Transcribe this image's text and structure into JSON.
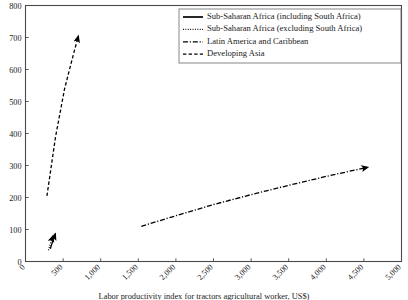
{
  "chart_data": {
    "type": "line",
    "title": "",
    "subtitle": "",
    "xlabel": "Labor productivity index for tractors agricultural worker, US$)",
    "ylabel": "",
    "xlim": [
      0,
      5000
    ],
    "ylim": [
      0,
      800
    ],
    "grid": false,
    "legend_position": "top-right",
    "xticks": [
      0,
      500,
      1000,
      1500,
      2000,
      2500,
      3000,
      3500,
      4000,
      4500,
      5000
    ],
    "xtick_labels": [
      "0",
      "500",
      "1,000",
      "1,500",
      "2,000",
      "2,500",
      "3,000",
      "3,500",
      "4,000",
      "4,500",
      "5,000"
    ],
    "yticks": [
      0,
      100,
      200,
      300,
      400,
      500,
      600,
      700,
      800
    ],
    "ytick_labels": [
      "0",
      "100",
      "200",
      "300",
      "400",
      "500",
      "600",
      "700",
      "800"
    ],
    "series": [
      {
        "name": "Sub-Saharan Africa (including South Africa)",
        "style": "solid",
        "arrow": true,
        "points": [
          [
            330,
            40
          ],
          [
            360,
            62
          ],
          [
            400,
            88
          ]
        ]
      },
      {
        "name": "Sub-Saharan Africa (excluding South Africa)",
        "style": "dotted",
        "arrow": true,
        "points": [
          [
            305,
            35
          ],
          [
            330,
            55
          ],
          [
            370,
            82
          ]
        ]
      },
      {
        "name": "Latin America and Caribbean",
        "style": "dashdot",
        "arrow": true,
        "points": [
          [
            1540,
            110
          ],
          [
            2000,
            143
          ],
          [
            2500,
            178
          ],
          [
            3000,
            209
          ],
          [
            3500,
            238
          ],
          [
            4000,
            266
          ],
          [
            4560,
            295
          ]
        ]
      },
      {
        "name": "Developing Asia",
        "style": "dashed",
        "arrow": true,
        "points": [
          [
            285,
            205
          ],
          [
            400,
            390
          ],
          [
            520,
            540
          ],
          [
            640,
            650
          ],
          [
            705,
            706
          ]
        ]
      }
    ]
  },
  "legend": {
    "entries": [
      {
        "label": "Sub-Saharan Africa (including South Africa)",
        "style": "solid"
      },
      {
        "label": "Sub-Saharan Africa (excluding South Africa)",
        "style": "dotted"
      },
      {
        "label": "Latin America and Caribbean",
        "style": "dashdot"
      },
      {
        "label": "Developing Asia",
        "style": "dashed"
      }
    ]
  },
  "colors": {
    "series": "#000000",
    "axis": "#4a4a4a",
    "text": "#1a1a1a",
    "background": "#ffffff"
  }
}
